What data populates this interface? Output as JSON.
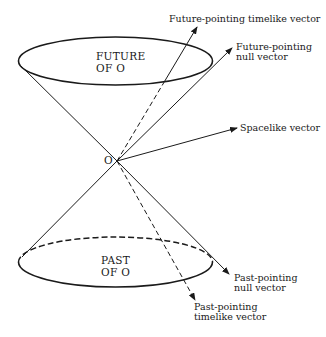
{
  "figure": {
    "apex_label": "O",
    "future_region": {
      "line1": "FUTURE",
      "line2": "OF O"
    },
    "past_region": {
      "line1": "PAST",
      "line2": "OF O"
    },
    "vectors": {
      "future_timelike": {
        "line1": "Future-pointing timelike vector"
      },
      "future_null": {
        "line1": "Future-pointing",
        "line2": "null vector"
      },
      "spacelike": {
        "line1": "Spacelike vector"
      },
      "past_null": {
        "line1": "Past-pointing",
        "line2": "null vector"
      },
      "past_timelike": {
        "line1": "Past-pointing",
        "line2": "timelike vector"
      }
    },
    "colors": {
      "ink": "#1a1a1a",
      "background": "#ffffff"
    }
  }
}
